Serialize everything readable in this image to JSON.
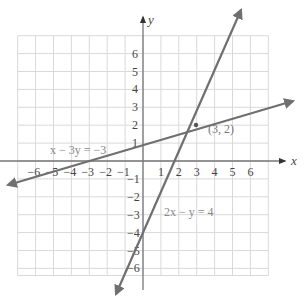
{
  "chart_data": {
    "type": "line",
    "title": "",
    "xlabel": "x",
    "ylabel": "y",
    "xlim": [
      -7,
      7
    ],
    "ylim": [
      -6.5,
      7
    ],
    "grid": true,
    "x_ticks": [
      "-6",
      "-5",
      "-4",
      "-3",
      "-2",
      "-1",
      "1",
      "2",
      "3",
      "4",
      "5",
      "6"
    ],
    "y_ticks": [
      "6",
      "5",
      "4",
      "3",
      "2",
      "1",
      "-1",
      "-2",
      "-3",
      "-4",
      "-5",
      "-6"
    ],
    "series": [
      {
        "name": "x - 3y = -3",
        "equation": "x - 3y = -3",
        "points": [
          [
            -7.6,
            -1.53
          ],
          [
            8.4,
            3.8
          ]
        ]
      },
      {
        "name": "2x - y = 4",
        "equation": "2x - y = 4",
        "points": [
          [
            -1.6,
            -7.2
          ],
          [
            5.6,
            7.2
          ]
        ]
      }
    ],
    "annotations": [
      {
        "text": "(3, 2)",
        "x": 3,
        "y": 2,
        "type": "intersection"
      },
      {
        "text": "x − 3y = −3",
        "near_series": "x - 3y = -3"
      },
      {
        "text": "2x − y = 4",
        "near_series": "2x - y = 4"
      }
    ]
  },
  "labels": {
    "x_axis": "x",
    "y_axis": "y",
    "eq1": "x − 3y = −3",
    "eq2": "2x − y = 4",
    "intersection": "(3, 2)"
  },
  "ticks": {
    "x": [
      {
        "v": -6,
        "t": "−6"
      },
      {
        "v": -5,
        "t": "−5"
      },
      {
        "v": -4,
        "t": "−4"
      },
      {
        "v": -3,
        "t": "−3"
      },
      {
        "v": -2,
        "t": "−2"
      },
      {
        "v": -1,
        "t": "−1"
      },
      {
        "v": 1,
        "t": "1"
      },
      {
        "v": 2,
        "t": "2"
      },
      {
        "v": 3,
        "t": "3"
      },
      {
        "v": 4,
        "t": "4"
      },
      {
        "v": 5,
        "t": "5"
      },
      {
        "v": 6,
        "t": "6"
      }
    ],
    "y": [
      {
        "v": 6,
        "t": "6"
      },
      {
        "v": 5,
        "t": "5"
      },
      {
        "v": 4,
        "t": "4"
      },
      {
        "v": 3,
        "t": "3"
      },
      {
        "v": 2,
        "t": "2"
      },
      {
        "v": 1,
        "t": "1"
      },
      {
        "v": -1,
        "t": "−1"
      },
      {
        "v": -2,
        "t": "−2"
      },
      {
        "v": -3,
        "t": "−3"
      },
      {
        "v": -4,
        "t": "−4"
      },
      {
        "v": -5,
        "t": "−5"
      },
      {
        "v": -6,
        "t": "−6"
      }
    ]
  },
  "colors": {
    "grid": "#d9d9d9",
    "axis": "#777777",
    "line": "#6f6f6f"
  }
}
